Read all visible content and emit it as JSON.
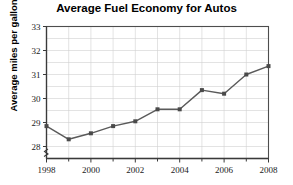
{
  "chart_data": {
    "type": "line",
    "title": "Average Fuel Economy for Autos",
    "xlabel": "",
    "ylabel": "Average miles per gallon",
    "x": [
      1998,
      1999,
      2000,
      2001,
      2002,
      2003,
      2004,
      2005,
      2006,
      2007,
      2008
    ],
    "values": [
      28.85,
      28.3,
      28.55,
      28.85,
      29.05,
      29.55,
      29.55,
      30.35,
      30.2,
      31.0,
      31.35
    ],
    "series": [
      {
        "name": "Average miles per gallon",
        "values": [
          28.85,
          28.3,
          28.55,
          28.85,
          29.05,
          29.55,
          29.55,
          30.35,
          30.2,
          31.0,
          31.35
        ]
      }
    ],
    "xlim": [
      1998,
      2008
    ],
    "ylim": [
      27.75,
      33
    ],
    "ytick_labels": [
      "28",
      "29",
      "30",
      "31",
      "32",
      "33"
    ],
    "ytick_values": [
      28,
      29,
      30,
      31,
      32,
      33
    ],
    "xtick_labels": [
      "1998",
      "2000",
      "2002",
      "2004",
      "2006",
      "2008"
    ],
    "xtick_values": [
      1998,
      2000,
      2002,
      2004,
      2006,
      2008
    ],
    "xminor_values": [
      1999,
      2001,
      2003,
      2005,
      2007
    ],
    "grid": true,
    "grid_y_step": 0.5,
    "grid_x_step": 1,
    "legend": false,
    "axis_break_y": true,
    "marker": "square",
    "line_color": "#5a5a5a",
    "marker_color": "#4a4a4a",
    "grid_color": "#d0d0d0",
    "axis_color": "#3a3a3a",
    "background": "#ffffff"
  }
}
